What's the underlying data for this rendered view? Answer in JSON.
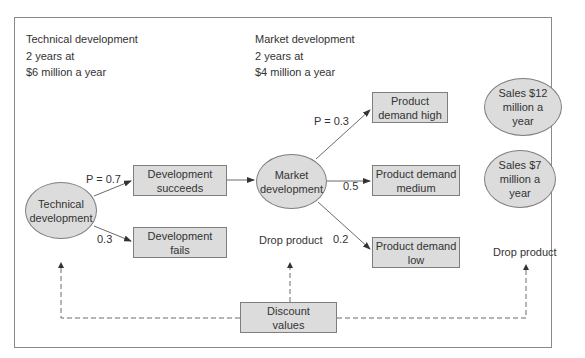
{
  "notes": {
    "technical": [
      "Technical development",
      "2 years at",
      "$6 million a year"
    ],
    "market": [
      "Market development",
      "2 years at",
      "$4 million a year"
    ]
  },
  "nodes": {
    "technical_development": "Technical\ndevelopment",
    "development_succeeds": "Development\nsucceeds",
    "development_fails": "Development\nfails",
    "market_development": "Market\ndevelopment",
    "product_demand_high": "Product\ndemand high",
    "product_demand_medium": "Product demand\nmedium",
    "product_demand_low": "Product demand\nlow",
    "sales_12": "Sales $12\nmillion a\nyear",
    "sales_7": "Sales $7\nmillion a\nyear",
    "drop_product_middle": "Drop product",
    "drop_product_right": "Drop product",
    "discount_values": "Discount\nvalues"
  },
  "probabilities": {
    "succeed": "P = 0.7",
    "fail": "0.3",
    "high": "P = 0.3",
    "medium": "0.5",
    "low": "0.2"
  },
  "colors": {
    "node_fill": "#dcdcdc",
    "node_border": "#7e7e7e",
    "frame_border": "#8a8a8a"
  }
}
